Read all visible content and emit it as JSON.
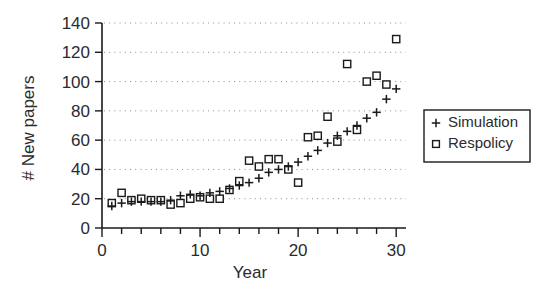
{
  "chart_data": {
    "type": "scatter",
    "title": "",
    "xlabel": "Year",
    "ylabel": "# New papers",
    "xlim": [
      0,
      31
    ],
    "ylim": [
      0,
      140
    ],
    "grid": true,
    "legend_position": "right",
    "x_ticks_major": [
      0,
      10,
      20,
      30
    ],
    "x_tick_labels": [
      "0",
      "10",
      "20",
      "30"
    ],
    "x_ticks_minor": [
      2,
      4,
      6,
      8,
      12,
      14,
      16,
      18,
      22,
      24,
      26,
      28
    ],
    "y_ticks": [
      0,
      20,
      40,
      60,
      80,
      100,
      120,
      140
    ],
    "y_tick_labels": [
      "0",
      "20",
      "40",
      "60",
      "80",
      "100",
      "120",
      "140"
    ],
    "x": [
      1,
      2,
      3,
      4,
      5,
      6,
      7,
      8,
      9,
      10,
      11,
      12,
      13,
      14,
      15,
      16,
      17,
      18,
      19,
      20,
      21,
      22,
      23,
      24,
      25,
      26,
      27,
      28,
      29,
      30
    ],
    "series": [
      {
        "name": "Simulation",
        "marker": "plus",
        "values": [
          15,
          17,
          18,
          18,
          18,
          18,
          19,
          22,
          23,
          22,
          24,
          25,
          27,
          29,
          31,
          34,
          38,
          40,
          42,
          45,
          49,
          53,
          58,
          63,
          66,
          70,
          75,
          79,
          88,
          95
        ]
      },
      {
        "name": "Respolicy",
        "marker": "square",
        "values": [
          17,
          24,
          19,
          20,
          19,
          19,
          16,
          17,
          20,
          21,
          20,
          20,
          26,
          32,
          46,
          42,
          47,
          47,
          40,
          31,
          62,
          63,
          76,
          59,
          112,
          67,
          100,
          104,
          98,
          129
        ]
      }
    ]
  },
  "legend": {
    "entries": [
      {
        "label": "Simulation",
        "marker": "plus"
      },
      {
        "label": "Respolicy",
        "marker": "square"
      }
    ]
  }
}
